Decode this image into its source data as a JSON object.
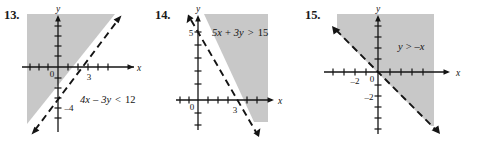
{
  "page": {
    "background_color": "#ffffff",
    "shade_color": "#c8c8c8",
    "ink_color": "#141414"
  },
  "problems": [
    {
      "number": "13.",
      "inequality": {
        "full": "4x - 3y < 12",
        "lhs_a": "4x",
        "op1": "–",
        "lhs_b": "3y",
        "relation": "<",
        "rhs": "12"
      },
      "boundary": {
        "style": "dashed",
        "x_intercept_label": "3",
        "y_intercept_label": "–4",
        "slope": "4/3",
        "arrow_ends": "both"
      },
      "axes": {
        "x_label": "x",
        "y_label": "y",
        "origin_label": "0",
        "tick_labels": [
          "3",
          "–4"
        ]
      },
      "shading": "upper-left"
    },
    {
      "number": "14.",
      "inequality": {
        "full": "5x + 3y > 15",
        "lhs_a": "5x",
        "op1": "+",
        "lhs_b": "3y",
        "relation": ">",
        "rhs": "15"
      },
      "boundary": {
        "style": "dashed",
        "x_intercept_label": "3",
        "y_intercept_label": "5",
        "slope": "-5/3",
        "arrow_ends": "both"
      },
      "axes": {
        "x_label": "x",
        "y_label": "y",
        "origin_label": "0",
        "tick_labels": [
          "5",
          "3"
        ]
      },
      "shading": "right"
    },
    {
      "number": "15.",
      "inequality": {
        "full": "y > -x",
        "lhs_a": "y",
        "relation": ">",
        "rhs": "–x"
      },
      "boundary": {
        "style": "dashed",
        "slope": "-1",
        "arrow_ends": "both"
      },
      "axes": {
        "x_label": "x",
        "y_label": "y",
        "origin_label": "0",
        "tick_labels": [
          "–2",
          "–2"
        ],
        "x_tick_label": "–2",
        "y_tick_label": "–2"
      },
      "shading": "upper-right"
    }
  ]
}
